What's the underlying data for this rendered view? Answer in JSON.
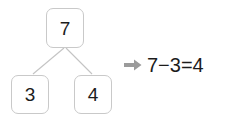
{
  "background_color": "#ffffff",
  "number_bond": {
    "whole": {
      "label": "7",
      "name": "whole-node"
    },
    "parts": [
      {
        "label": "3",
        "name": "part-node-left"
      },
      {
        "label": "4",
        "name": "part-node-right"
      }
    ],
    "box_border_color": "#c9c9c9",
    "box_fill_color": "#ffffff",
    "digit_color": "#1c1c1c",
    "connector_color": "#c4c4c4"
  },
  "equation": {
    "arrow_icon": "arrow-right-icon",
    "arrow_color": "#9b9b9b",
    "text": "7−3=4",
    "text_color": "#1c1c1c",
    "minuend": "7",
    "subtrahend": "3",
    "difference": "4",
    "operator": "−",
    "equals": "="
  }
}
